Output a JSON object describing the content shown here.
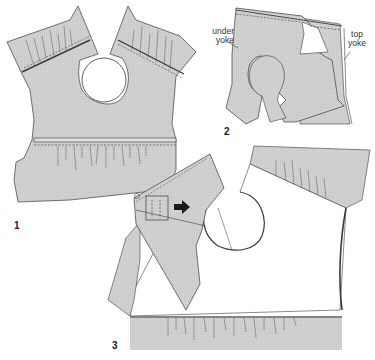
{
  "diagram": {
    "type": "sewing-instruction-illustration",
    "colors": {
      "fabric_fill": "#cfcfcf",
      "outline": "#3a3a3a",
      "background": "#ffffff",
      "arrow": "#1a1a1a"
    },
    "steps": [
      {
        "number": "1",
        "description": "Front bodice with gathered shoulder yokes and gathered waist seam"
      },
      {
        "number": "2",
        "description": "Under yoke and top yoke layered"
      },
      {
        "number": "3",
        "description": "Yoke folded over and pulled through, with arrow"
      }
    ],
    "labels": {
      "under_yoke_line1": "under",
      "under_yoke_line2": "yoke",
      "top_yoke_line1": "top",
      "top_yoke_line2": "yoke"
    }
  }
}
